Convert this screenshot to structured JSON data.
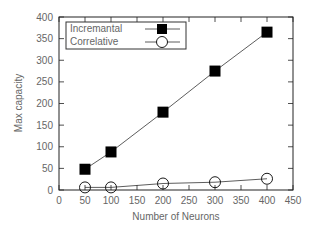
{
  "chart_data": {
    "type": "line",
    "title": "",
    "xlabel": "Number of Neurons",
    "ylabel": "Max capacity",
    "xlim": [
      0,
      450
    ],
    "ylim": [
      0,
      400
    ],
    "xticks": [
      0,
      50,
      100,
      150,
      200,
      250,
      300,
      350,
      400,
      450
    ],
    "yticks": [
      0,
      50,
      100,
      150,
      200,
      250,
      300,
      350,
      400
    ],
    "grid": false,
    "legend_position": "upper left",
    "x": [
      50,
      100,
      200,
      300,
      400
    ],
    "series": [
      {
        "name": "Incremantal",
        "marker": "filled-square",
        "values": [
          48,
          88,
          180,
          275,
          365
        ]
      },
      {
        "name": "Correlative",
        "marker": "open-circle",
        "values": [
          6,
          6,
          15,
          18,
          26
        ]
      }
    ]
  },
  "colors": {
    "axis": "#222222",
    "text": "#666666",
    "line": "#333333",
    "marker": "#000000"
  }
}
